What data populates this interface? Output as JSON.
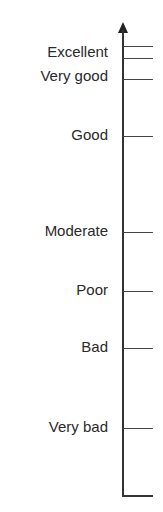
{
  "scale": {
    "levels": [
      {
        "label": "Excellent",
        "label_y": 52,
        "tick_y": null
      },
      {
        "label": "Very good",
        "label_y": 76,
        "tick_y": 79
      },
      {
        "label": "Good",
        "label_y": 135,
        "tick_y": 136
      },
      {
        "label": "Moderate",
        "label_y": 231,
        "tick_y": 232
      },
      {
        "label": "Poor",
        "label_y": 290,
        "tick_y": 291
      },
      {
        "label": "Bad",
        "label_y": 347,
        "tick_y": 348
      },
      {
        "label": "Very bad",
        "label_y": 427,
        "tick_y": 428
      }
    ],
    "top_ticks": [
      46,
      58
    ],
    "axis": {
      "top": 30,
      "bottom": 495
    },
    "baseline_y": 495
  }
}
